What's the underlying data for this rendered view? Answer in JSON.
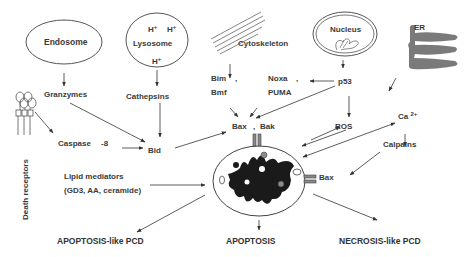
{
  "diagram": {
    "type": "cell-death-pathway-diagram",
    "organelles": {
      "endosome": "Endosome",
      "lysosome": "Lysosome",
      "lysosome_ions": [
        "H+",
        "H+",
        "H+"
      ],
      "cytoskeleton": "Cytoskeleton",
      "nucleus": "Nucleus",
      "er": "ER",
      "death_receptors": "Death receptors"
    },
    "mediators": {
      "granzymes": "Granzymes",
      "cathepsins": "Cathepsins",
      "caspase": "Caspase",
      "caspase_num": "-8",
      "bid": "Bid",
      "bim": "Bim",
      "bim_comma": ",",
      "bmf": "Bmf",
      "noxa": "Noxa",
      "noxa_comma": ",",
      "puma": "PUMA",
      "p53": "p53",
      "bax": "Bax",
      "bax_bak_sep": ",",
      "bak": "Bak",
      "ros": "ROS",
      "ca": "Ca",
      "ca_charge": "2+",
      "calpains": "Calpains",
      "bax_membrane": "Bax",
      "lipid_line1": "Lipid  mediators",
      "lipid_line2": "(GD3, AA, ceramide)"
    },
    "outcomes": {
      "left": "APOPTOSIS-like PCD",
      "center": "APOPTOSIS",
      "right": "NECROSIS-like PCD"
    },
    "colors": {
      "line": "#333333",
      "er_fill": "#7a7a7a",
      "mito_matrix": "#1a1a1a",
      "mito_granule": "#8a8a8a",
      "text": "#3a3a3a"
    }
  }
}
